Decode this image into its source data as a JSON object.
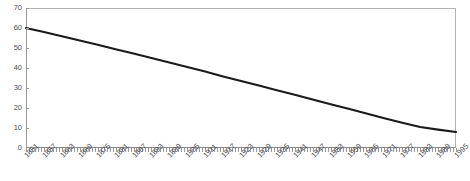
{
  "chart_data": {
    "type": "line",
    "title": "",
    "subtitle": "",
    "xlabel": "",
    "ylabel": "",
    "xlim": [
      1851,
      1995
    ],
    "ylim": [
      0,
      70
    ],
    "yticks": [
      0,
      10,
      20,
      30,
      40,
      50,
      60,
      70
    ],
    "grid": false,
    "legend": null,
    "legend_position": "none",
    "line_color": "#1a1a1a",
    "axis_color": "#9a9a9a",
    "border_color": "#b3b3b3",
    "tick_label_color": "#4d4d4d",
    "tick_label_rotation": -45,
    "xtick_labels": [
      "1851",
      "1857",
      "1863",
      "1869",
      "1875",
      "1881",
      "1887",
      "1893",
      "1899",
      "1905",
      "1911",
      "1917",
      "1923",
      "1929",
      "1935",
      "1941",
      "1947",
      "1953",
      "1959",
      "1965",
      "1971",
      "1977",
      "1983",
      "1989",
      "1995"
    ],
    "xtick_interval_years": 6,
    "series": [
      {
        "name": "series-1",
        "x": [
          1851,
          1857,
          1863,
          1869,
          1875,
          1881,
          1887,
          1893,
          1899,
          1905,
          1911,
          1917,
          1923,
          1929,
          1935,
          1941,
          1947,
          1953,
          1959,
          1965,
          1971,
          1977,
          1983,
          1989,
          1995
        ],
        "values": [
          60.0,
          58.0,
          55.9,
          53.8,
          51.6,
          49.4,
          47.2,
          45.0,
          42.8,
          40.5,
          38.2,
          35.8,
          33.5,
          31.2,
          28.9,
          26.6,
          24.3,
          21.9,
          19.6,
          17.2,
          14.9,
          12.6,
          10.5,
          9.2,
          8.0
        ]
      }
    ]
  }
}
